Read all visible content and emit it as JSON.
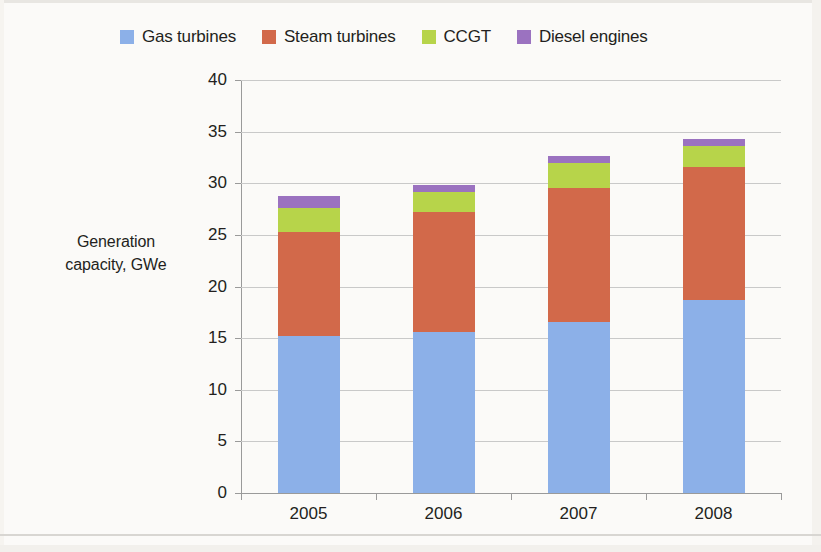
{
  "chart_data": {
    "type": "bar",
    "stacked": true,
    "title": "",
    "xlabel": "",
    "ylabel": "Generation capacity, GWe",
    "categories": [
      "2005",
      "2006",
      "2007",
      "2008"
    ],
    "ylim": [
      0,
      40
    ],
    "yticks": [
      0,
      5,
      10,
      15,
      20,
      25,
      30,
      35,
      40
    ],
    "ytick_labels": [
      "0",
      "5",
      "10",
      "15",
      "20",
      "25",
      "30",
      "35",
      "40"
    ],
    "grid": "horizontal",
    "legend_position": "top",
    "series": [
      {
        "name": "Gas turbines",
        "color": "#8cb0e8",
        "values": [
          15.2,
          15.6,
          16.6,
          18.7
        ]
      },
      {
        "name": "Steam turbines",
        "color": "#d2694a",
        "values": [
          10.1,
          11.6,
          12.9,
          12.9
        ]
      },
      {
        "name": "CCGT",
        "color": "#b7d44a",
        "values": [
          2.3,
          2.0,
          2.5,
          2.0
        ]
      },
      {
        "name": "Diesel engines",
        "color": "#9b72c0",
        "values": [
          1.2,
          0.6,
          0.6,
          0.7
        ]
      }
    ],
    "totals": [
      28.8,
      29.8,
      32.6,
      34.3
    ]
  },
  "axis_title": {
    "line1": "Generation",
    "line2": "capacity, GWe"
  },
  "legend": {
    "items": [
      {
        "label": "Gas turbines",
        "color": "#8cb0e8",
        "swatch_name": "legend-swatch-gas-turbines"
      },
      {
        "label": "Steam turbines",
        "color": "#d2694a",
        "swatch_name": "legend-swatch-steam-turbines"
      },
      {
        "label": "CCGT",
        "color": "#b7d44a",
        "swatch_name": "legend-swatch-ccgt"
      },
      {
        "label": "Diesel engines",
        "color": "#9b72c0",
        "swatch_name": "legend-swatch-diesel-engines"
      }
    ]
  }
}
